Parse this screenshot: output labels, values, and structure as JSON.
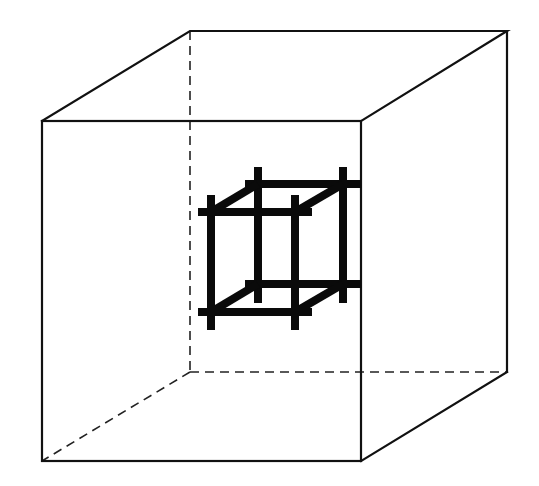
{
  "figure": {
    "outer_cube": {
      "front": {
        "tl": [
          42,
          121
        ],
        "tr": [
          361,
          121
        ],
        "br": [
          361,
          461
        ],
        "bl": [
          42,
          461
        ]
      },
      "back": {
        "tl": [
          190,
          31
        ],
        "tr": [
          507,
          31
        ],
        "br": [
          507,
          372
        ],
        "bl": [
          190,
          372
        ]
      },
      "hidden_edges": [
        "back-left-vertical",
        "back-bottom-horizontal",
        "back-bottom-left-diagonal"
      ],
      "line_color": "#111111"
    },
    "inner_cube": {
      "style": "thick bars with overhanging ends",
      "bar_color": "#0a0a0a",
      "front": {
        "left_x": 211,
        "right_x": 295,
        "top_y": 212,
        "bottom_y": 312
      },
      "back": {
        "left_x": 258,
        "right_x": 343,
        "top_y": 183,
        "bottom_y": 284
      }
    }
  }
}
